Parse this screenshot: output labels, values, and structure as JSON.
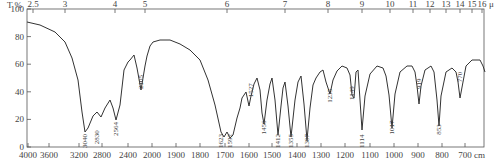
{
  "chart_data": {
    "type": "line",
    "title": "",
    "ylabel": "T %",
    "xlabel": "cm-1",
    "top_axis_label": "μm",
    "ylim": [
      0,
      100
    ],
    "yticks": [
      0,
      20,
      40,
      60,
      80,
      100
    ],
    "bottom_ticks": [
      "4000",
      "3600",
      "3200",
      "2800",
      "2400",
      "2000",
      "1900",
      "1800",
      "1700",
      "1600",
      "1500",
      "1400",
      "1300",
      "1200",
      "1100",
      "1000",
      "900",
      "800",
      "700"
    ],
    "bottom_unit": "cm",
    "top_ticks": [
      "2.5",
      "3",
      "4",
      "5",
      "6",
      "7",
      "8",
      "9",
      "10",
      "11",
      "12",
      "13",
      "14",
      "15",
      "16"
    ],
    "top_unit": "μ",
    "grid": false,
    "peaks": [
      {
        "wavenumber": 3040,
        "label": "3040",
        "T": 8
      },
      {
        "wavenumber": 2830,
        "label": "2830",
        "T": 18
      },
      {
        "wavenumber": 2564,
        "label": "2564",
        "T": 24
      },
      {
        "wavenumber": 2105,
        "label": "2105",
        "T": 58
      },
      {
        "wavenumber": 1623,
        "label": "1623",
        "T": 5
      },
      {
        "wavenumber": 1592,
        "label": "1592",
        "T": 3
      },
      {
        "wavenumber": 1527,
        "label": "1527",
        "T": 52
      },
      {
        "wavenumber": 1456,
        "label": "1456",
        "T": 25
      },
      {
        "wavenumber": 1412,
        "label": "1412",
        "T": 12
      },
      {
        "wavenumber": 1355,
        "label": "1355",
        "T": 10
      },
      {
        "wavenumber": 1307,
        "label": "1307",
        "T": 15
      },
      {
        "wavenumber": 1235,
        "label": "1235",
        "T": 48
      },
      {
        "wavenumber": 1149,
        "label": "1149",
        "T": 50
      },
      {
        "wavenumber": 1114,
        "label": "1114",
        "T": 10
      },
      {
        "wavenumber": 1017,
        "label": "1017",
        "T": 25
      },
      {
        "wavenumber": 919,
        "label": "919",
        "T": 55
      },
      {
        "wavenumber": 853,
        "label": "853",
        "T": 22
      },
      {
        "wavenumber": 770,
        "label": "770",
        "T": 60
      }
    ]
  },
  "axis": {
    "y_title": "T %",
    "x_unit": "cm",
    "top_unit": "μ"
  }
}
